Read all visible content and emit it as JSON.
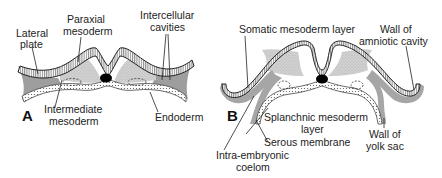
{
  "figure": {
    "panels": [
      {
        "id": "A",
        "letter": "A",
        "labels": {
          "lateral_plate_1": "Lateral",
          "lateral_plate_2": "plate",
          "paraxial_1": "Paraxial",
          "paraxial_2": "mesoderm",
          "intercellular_1": "Intercellular",
          "intercellular_2": "cavities",
          "intermediate_1": "Intermediate",
          "intermediate_2": "mesoderm",
          "endoderm": "Endoderm"
        }
      },
      {
        "id": "B",
        "letter": "B",
        "labels": {
          "somatic": "Somatic mesoderm layer",
          "wall_amniotic_1": "Wall of",
          "wall_amniotic_2": "amniotic cavity",
          "splanchnic_1": "Splanchnic mesoderm",
          "splanchnic_2": "layer",
          "serous": "Serous membrane",
          "wall_yolk_1": "Wall of",
          "wall_yolk_2": "yolk sac",
          "coelom_1": "Intra-embryonic",
          "coelom_2": "coelom"
        }
      }
    ],
    "colors": {
      "ectoderm_stroke": "#222222",
      "mesoderm_fill": "#c9c9c9",
      "lateral_plate_fill": "#9a9a9a",
      "notochord": "#000000",
      "background": "#ffffff"
    }
  }
}
